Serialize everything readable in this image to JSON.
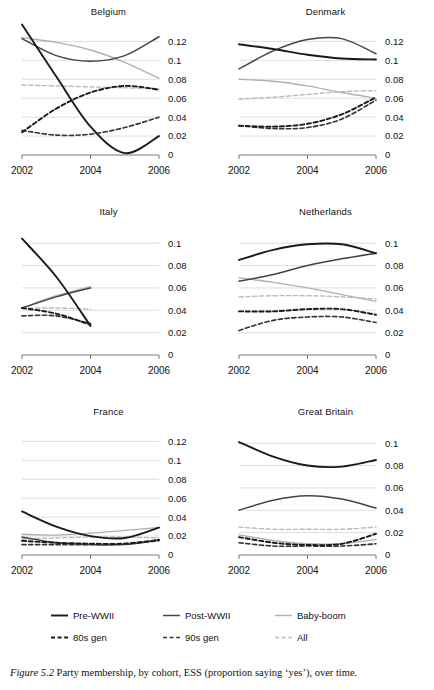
{
  "figure": {
    "caption_label": "Figure 5.2",
    "caption_text": "Party membership, by cohort, ESS (proportion saying ‘yes’), over time."
  },
  "legend": {
    "rows": [
      [
        {
          "label": "Pre-WWII",
          "style": "solid",
          "color": "#1a1a1a",
          "width": 1.9
        },
        {
          "label": "Post-WWII",
          "style": "solid",
          "color": "#444444",
          "width": 1.5
        },
        {
          "label": "Baby-boom",
          "style": "solid",
          "color": "#b0b0b0",
          "width": 1.4
        }
      ],
      [
        {
          "label": "80s gen",
          "style": "dashed",
          "color": "#1a1a1a",
          "width": 1.9
        },
        {
          "label": "90s gen",
          "style": "dashed",
          "color": "#333333",
          "width": 1.6
        },
        {
          "label": "All",
          "style": "dashed",
          "color": "#bbbbbb",
          "width": 1.4
        }
      ]
    ]
  },
  "series_style": {
    "Pre-WWII": {
      "style": "solid",
      "color": "#1a1a1a",
      "width": 1.9
    },
    "Post-WWII": {
      "style": "solid",
      "color": "#444444",
      "width": 1.5
    },
    "Baby-boom": {
      "style": "solid",
      "color": "#b0b0b0",
      "width": 1.4
    },
    "80s gen": {
      "style": "dashed",
      "color": "#1a1a1a",
      "width": 1.9
    },
    "90s gen": {
      "style": "dashed",
      "color": "#333333",
      "width": 1.6
    },
    "All": {
      "style": "dashed",
      "color": "#bbbbbb",
      "width": 1.4
    }
  },
  "chart_data": [
    {
      "type": "line",
      "title": "Belgium",
      "xlabel": "",
      "ylabel": "",
      "x": [
        2002,
        2003,
        2004,
        2005,
        2006
      ],
      "xlim": [
        2002,
        2006
      ],
      "xticks": [
        2002,
        2004,
        2006
      ],
      "xticklabels": [
        "2002",
        "2004",
        "2006"
      ],
      "ylim": [
        0,
        0.13
      ],
      "yticks": [
        0,
        0.02,
        0.04,
        0.06,
        0.08,
        0.1,
        0.12
      ],
      "yticklabels": [
        "0",
        "0.02",
        "0.04",
        "0.06",
        "0.08",
        "0.1",
        "0.12"
      ],
      "grid": true,
      "legend_position": "figure-bottom",
      "series": [
        {
          "name": "Pre-WWII",
          "values": [
            0.138,
            0.083,
            0.03,
            0.002,
            0.02
          ]
        },
        {
          "name": "Post-WWII",
          "values": [
            0.123,
            0.105,
            0.099,
            0.105,
            0.125
          ]
        },
        {
          "name": "Baby-boom",
          "values": [
            0.124,
            0.119,
            0.111,
            0.098,
            0.081
          ]
        },
        {
          "name": "80s gen",
          "values": [
            0.024,
            0.049,
            0.066,
            0.073,
            0.069
          ]
        },
        {
          "name": "90s gen",
          "values": [
            0.026,
            0.021,
            0.022,
            0.029,
            0.04
          ]
        },
        {
          "name": "All",
          "values": [
            0.074,
            0.073,
            0.072,
            0.071,
            0.07
          ]
        }
      ]
    },
    {
      "type": "line",
      "title": "Denmark",
      "xlabel": "",
      "ylabel": "",
      "x": [
        2002,
        2003,
        2004,
        2005,
        2006
      ],
      "xlim": [
        2002,
        2006
      ],
      "xticks": [
        2002,
        2004,
        2006
      ],
      "xticklabels": [
        "2002",
        "2004",
        "2006"
      ],
      "ylim": [
        0,
        0.13
      ],
      "yticks": [
        0,
        0.02,
        0.04,
        0.06,
        0.08,
        0.1,
        0.12
      ],
      "yticklabels": [
        "0",
        "0.02",
        "0.04",
        "0.06",
        "0.08",
        "0.1",
        "0.12"
      ],
      "grid": true,
      "legend_position": "figure-bottom",
      "series": [
        {
          "name": "Pre-WWII",
          "values": [
            0.117,
            0.112,
            0.106,
            0.102,
            0.101
          ]
        },
        {
          "name": "Post-WWII",
          "values": [
            0.091,
            0.11,
            0.122,
            0.123,
            0.107
          ]
        },
        {
          "name": "Baby-boom",
          "values": [
            0.08,
            0.078,
            0.073,
            0.066,
            0.06
          ]
        },
        {
          "name": "80s gen",
          "values": [
            0.031,
            0.03,
            0.033,
            0.043,
            0.061
          ]
        },
        {
          "name": "90s gen",
          "values": [
            0.031,
            0.028,
            0.029,
            0.038,
            0.058
          ]
        },
        {
          "name": "All",
          "values": [
            0.059,
            0.061,
            0.064,
            0.067,
            0.068
          ]
        }
      ]
    },
    {
      "type": "line",
      "title": "Italy",
      "xlabel": "",
      "ylabel": "",
      "x": [
        2002,
        2003,
        2004
      ],
      "xlim": [
        2002,
        2006
      ],
      "xticks": [
        2002,
        2004,
        2006
      ],
      "xticklabels": [
        "2002",
        "2004",
        "2006"
      ],
      "ylim": [
        0,
        0.11
      ],
      "yticks": [
        0,
        0.02,
        0.04,
        0.06,
        0.08,
        0.1
      ],
      "yticklabels": [
        "0",
        "0.02",
        "0.04",
        "0.06",
        "0.08",
        "0.1"
      ],
      "grid": true,
      "legend_position": "figure-bottom",
      "series": [
        {
          "name": "Pre-WWII",
          "values": [
            0.104,
            0.07,
            0.026
          ]
        },
        {
          "name": "Post-WWII",
          "values": [
            0.042,
            0.052,
            0.06
          ]
        },
        {
          "name": "Baby-boom",
          "values": [
            0.042,
            0.053,
            0.061
          ]
        },
        {
          "name": "80s gen",
          "values": [
            0.042,
            0.037,
            0.027
          ]
        },
        {
          "name": "90s gen",
          "values": [
            0.035,
            0.035,
            0.028
          ]
        },
        {
          "name": "All",
          "values": [
            0.042,
            0.042,
            0.041
          ]
        }
      ]
    },
    {
      "type": "line",
      "title": "Netherlands",
      "xlabel": "",
      "ylabel": "",
      "x": [
        2002,
        2003,
        2004,
        2005,
        2006
      ],
      "xlim": [
        2002,
        2006
      ],
      "xticks": [
        2002,
        2004,
        2006
      ],
      "xticklabels": [
        "2002",
        "2004",
        "2006"
      ],
      "ylim": [
        0,
        0.11
      ],
      "yticks": [
        0,
        0.02,
        0.04,
        0.06,
        0.08,
        0.1
      ],
      "yticklabels": [
        "0",
        "0.02",
        "0.04",
        "0.06",
        "0.08",
        "0.1"
      ],
      "grid": true,
      "legend_position": "figure-bottom",
      "series": [
        {
          "name": "Pre-WWII",
          "values": [
            0.085,
            0.094,
            0.099,
            0.099,
            0.091
          ]
        },
        {
          "name": "Post-WWII",
          "values": [
            0.066,
            0.072,
            0.08,
            0.086,
            0.091
          ]
        },
        {
          "name": "Baby-boom",
          "values": [
            0.069,
            0.065,
            0.06,
            0.054,
            0.048
          ]
        },
        {
          "name": "80s gen",
          "values": [
            0.039,
            0.039,
            0.041,
            0.041,
            0.036
          ]
        },
        {
          "name": "90s gen",
          "values": [
            0.022,
            0.031,
            0.034,
            0.034,
            0.029
          ]
        },
        {
          "name": "All",
          "values": [
            0.052,
            0.053,
            0.053,
            0.052,
            0.05
          ]
        }
      ]
    },
    {
      "type": "line",
      "title": "France",
      "xlabel": "",
      "ylabel": "",
      "x": [
        2002,
        2003,
        2004,
        2005,
        2006
      ],
      "xlim": [
        2002,
        2006
      ],
      "xticks": [
        2002,
        2004,
        2006
      ],
      "xticklabels": [
        "2002",
        "2004",
        "2006"
      ],
      "ylim": [
        0,
        0.13
      ],
      "yticks": [
        0,
        0.02,
        0.04,
        0.06,
        0.08,
        0.1,
        0.12
      ],
      "yticklabels": [
        "0",
        "0.02",
        "0.04",
        "0.06",
        "0.08",
        "0.1",
        "0.12"
      ],
      "grid": true,
      "legend_position": "figure-bottom",
      "series": [
        {
          "name": "Pre-WWII",
          "values": [
            0.046,
            0.03,
            0.02,
            0.018,
            0.029
          ]
        },
        {
          "name": "Post-WWII",
          "values": [
            0.019,
            0.013,
            0.011,
            0.011,
            0.016
          ]
        },
        {
          "name": "Baby-boom",
          "values": [
            0.022,
            0.021,
            0.023,
            0.026,
            0.029
          ]
        },
        {
          "name": "80s gen",
          "values": [
            0.015,
            0.013,
            0.012,
            0.012,
            0.016
          ]
        },
        {
          "name": "90s gen",
          "values": [
            0.011,
            0.011,
            0.011,
            0.012,
            0.015
          ]
        },
        {
          "name": "All",
          "values": [
            0.017,
            0.018,
            0.019,
            0.019,
            0.018
          ]
        }
      ]
    },
    {
      "type": "line",
      "title": "Great Britain",
      "xlabel": "",
      "ylabel": "",
      "x": [
        2002,
        2003,
        2004,
        2005,
        2006
      ],
      "xlim": [
        2002,
        2006
      ],
      "xticks": [
        2002,
        2004,
        2006
      ],
      "xticklabels": [
        "2002",
        "2004",
        "2006"
      ],
      "ylim": [
        0,
        0.11
      ],
      "yticks": [
        0,
        0.02,
        0.04,
        0.06,
        0.08,
        0.1
      ],
      "yticklabels": [
        "0",
        "0.02",
        "0.04",
        "0.06",
        "0.08",
        "0.1"
      ],
      "grid": true,
      "legend_position": "figure-bottom",
      "series": [
        {
          "name": "Pre-WWII",
          "values": [
            0.101,
            0.088,
            0.08,
            0.079,
            0.085
          ]
        },
        {
          "name": "Post-WWII",
          "values": [
            0.04,
            0.049,
            0.053,
            0.05,
            0.042
          ]
        },
        {
          "name": "Baby-boom",
          "values": [
            0.018,
            0.013,
            0.01,
            0.01,
            0.014
          ]
        },
        {
          "name": "80s gen",
          "values": [
            0.016,
            0.011,
            0.009,
            0.01,
            0.019
          ]
        },
        {
          "name": "90s gen",
          "values": [
            0.011,
            0.008,
            0.008,
            0.008,
            0.01
          ]
        },
        {
          "name": "All",
          "values": [
            0.025,
            0.023,
            0.023,
            0.023,
            0.025
          ]
        }
      ]
    }
  ]
}
